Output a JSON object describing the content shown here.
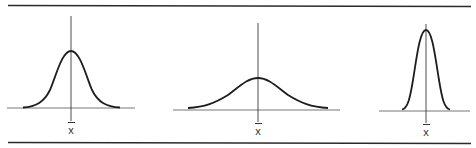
{
  "figure": {
    "panels": [
      {
        "id": "medium",
        "label": "x",
        "label_marker": "mean (x-bar)"
      },
      {
        "id": "wide",
        "label": "x",
        "label_marker": "mean (x-bar)"
      },
      {
        "id": "narrow",
        "label": "x",
        "label_marker": "mean (x-bar)"
      }
    ]
  },
  "colors": {
    "rule": "#2a2a2a",
    "curve": "#1e1e1e",
    "baseline": "#777777"
  }
}
